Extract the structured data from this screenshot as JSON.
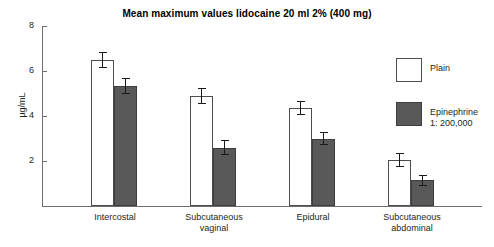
{
  "chart_data": {
    "type": "bar",
    "title": "Mean maximum values lidocaine 20 ml 2% (400 mg)",
    "xlabel": "",
    "ylabel": "µg/mL",
    "ylim": [
      0,
      8
    ],
    "yticks": [
      2,
      4,
      6,
      8
    ],
    "ytick_labels": [
      "2",
      "4",
      "6",
      "8"
    ],
    "grid": false,
    "legend_position": "right",
    "categories": [
      "Intercostal",
      "Subcutaneous\nvaginal",
      "Epidural",
      "Subcutaneous\nabdominal"
    ],
    "series": [
      {
        "name": "Plain",
        "color": "#ffffff",
        "values": [
          6.5,
          4.9,
          4.35,
          2.05
        ],
        "errors": [
          0.35,
          0.35,
          0.3,
          0.3
        ]
      },
      {
        "name": "Epinephrine\n1: 200,000",
        "color": "#595959",
        "values": [
          5.35,
          2.6,
          3.0,
          1.15
        ],
        "errors": [
          0.35,
          0.35,
          0.3,
          0.25
        ]
      }
    ]
  },
  "legend": {
    "entries": [
      {
        "label": "Plain"
      },
      {
        "label": "Epinephrine\n1: 200,000"
      }
    ]
  }
}
